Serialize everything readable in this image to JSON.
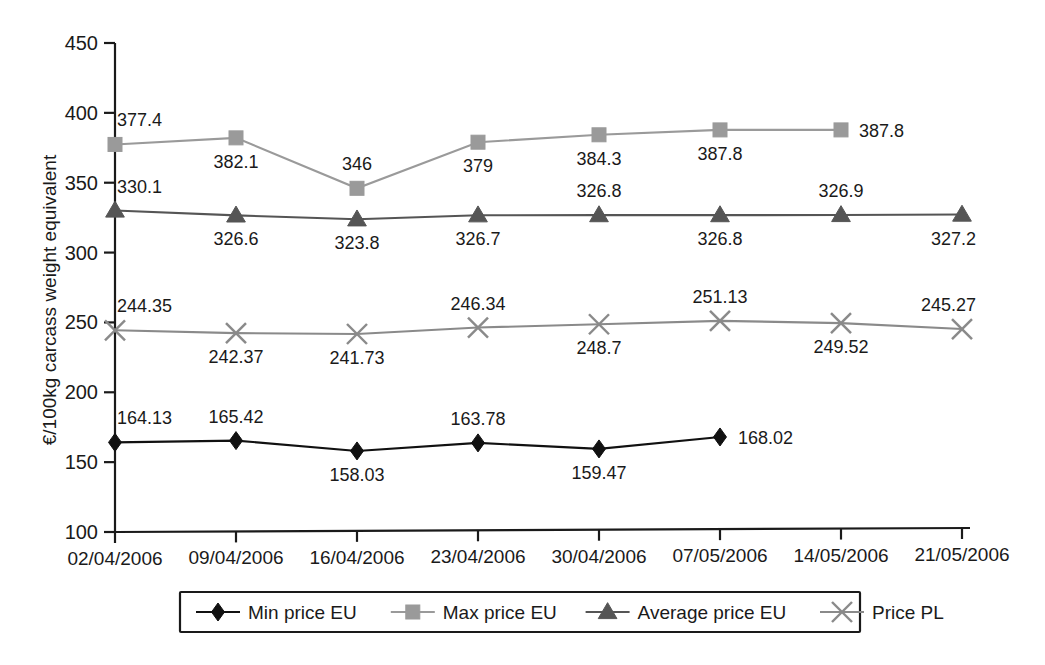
{
  "chart_data": {
    "type": "line",
    "title": "",
    "xlabel": "",
    "ylabel": "€/100kg carcass weight equivalent",
    "ylim": [
      100,
      450
    ],
    "ytick_values": [
      100,
      150,
      200,
      250,
      300,
      350,
      400,
      450
    ],
    "ytick_labels": [
      "100",
      "150",
      "200",
      "250",
      "300",
      "350",
      "400",
      "450"
    ],
    "grid": false,
    "legend_position": "bottom",
    "categories": [
      "02/04/2006",
      "09/04/2006",
      "16/04/2006",
      "23/04/2006",
      "30/04/2006",
      "07/05/2006",
      "14/05/2006",
      "21/05/2006"
    ],
    "series": [
      {
        "name": "Min price EU",
        "marker": "diamond",
        "color": "#111111",
        "values": [
          164.13,
          165.42,
          158.03,
          163.78,
          159.47,
          168.02,
          null,
          null
        ],
        "labels": [
          "164.13",
          "165.42",
          "158.03",
          "163.78",
          "159.47",
          "168.02",
          "",
          ""
        ],
        "label_positions": [
          "above",
          "above",
          "below",
          "above",
          "below",
          "right",
          "",
          ""
        ]
      },
      {
        "name": "Max price EU",
        "marker": "square",
        "color": "#9a9a9a",
        "values": [
          377.4,
          382.1,
          346,
          379,
          384.3,
          387.8,
          387.8,
          null
        ],
        "labels": [
          "377.4",
          "382.1",
          "346",
          "379",
          "384.3",
          "387.8",
          "387.8",
          ""
        ],
        "label_positions": [
          "above",
          "below",
          "above",
          "below",
          "below",
          "below",
          "right",
          ""
        ]
      },
      {
        "name": "Average price EU",
        "marker": "triangle",
        "color": "#555555",
        "values": [
          330.1,
          326.6,
          323.8,
          326.7,
          326.8,
          326.8,
          326.9,
          327.2
        ],
        "labels": [
          "330.1",
          "326.6",
          "323.8",
          "326.7",
          "326.8",
          "326.8",
          "326.9",
          "327.2"
        ],
        "label_positions": [
          "above",
          "below",
          "below",
          "below",
          "above",
          "below",
          "above",
          "below"
        ]
      },
      {
        "name": "Price PL",
        "marker": "cross",
        "color": "#8a8a8a",
        "values": [
          244.35,
          242.37,
          241.73,
          246.34,
          248.7,
          251.13,
          249.52,
          245.27
        ],
        "labels": [
          "244.35",
          "242.37",
          "241.73",
          "246.34",
          "248.7",
          "251.13",
          "249.52",
          "245.27"
        ],
        "label_positions": [
          "above",
          "below",
          "below",
          "above",
          "below",
          "above",
          "below",
          "above"
        ]
      }
    ]
  },
  "legend": {
    "items": [
      {
        "label": "Min price EU",
        "marker": "diamond",
        "color": "#111111"
      },
      {
        "label": "Max price EU",
        "marker": "square",
        "color": "#9a9a9a"
      },
      {
        "label": "Average price EU",
        "marker": "triangle",
        "color": "#555555"
      },
      {
        "label": "Price PL",
        "marker": "cross",
        "color": "#8a8a8a"
      }
    ]
  }
}
